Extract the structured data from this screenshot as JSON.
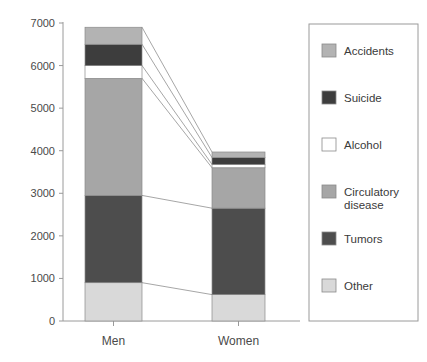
{
  "chart_data": {
    "type": "bar",
    "subtype": "stacked",
    "title": "",
    "xlabel": "",
    "ylabel": "",
    "categories": [
      "Men",
      "Women"
    ],
    "ylim": [
      0,
      7000
    ],
    "yticks": [
      0,
      1000,
      2000,
      3000,
      4000,
      5000,
      6000,
      7000
    ],
    "ytick_labels": [
      "0",
      "1000",
      "2000",
      "3000",
      "4000",
      "5000",
      "6000",
      "7000"
    ],
    "grid": false,
    "legend_position": "right",
    "stack_order_bottom_to_top": [
      "Other",
      "Tumors",
      "Circulatory disease",
      "Alcohol",
      "Suicide",
      "Accidents"
    ],
    "series": [
      {
        "name": "Other",
        "color": "#d9d9d9",
        "values": [
          900,
          620
        ]
      },
      {
        "name": "Tumors",
        "color": "#4d4d4d",
        "values": [
          2050,
          2030
        ]
      },
      {
        "name": "Circulatory disease",
        "color": "#a6a6a6",
        "values": [
          2750,
          950
        ]
      },
      {
        "name": "Alcohol",
        "color": "#ffffff",
        "values": [
          300,
          80
        ]
      },
      {
        "name": "Suicide",
        "color": "#3d3d3d",
        "values": [
          500,
          160
        ]
      },
      {
        "name": "Accidents",
        "color": "#b3b3b3",
        "values": [
          400,
          130
        ]
      }
    ],
    "totals": [
      6900,
      3970
    ],
    "connectors": true
  },
  "legend": {
    "items": [
      {
        "label": "Accidents",
        "color": "#b3b3b3"
      },
      {
        "label": "Suicide",
        "color": "#3d3d3d"
      },
      {
        "label": "Alcohol",
        "color": "#ffffff"
      },
      {
        "label": "Circulatory disease",
        "color": "#a6a6a6"
      },
      {
        "label": "Tumors",
        "color": "#4d4d4d"
      },
      {
        "label": "Other",
        "color": "#d9d9d9"
      }
    ]
  }
}
